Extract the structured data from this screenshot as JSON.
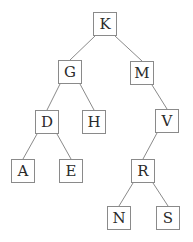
{
  "diagram": {
    "type": "binary-tree",
    "nodes": [
      {
        "id": "K",
        "label": "K",
        "x": 93,
        "y": 12
      },
      {
        "id": "G",
        "label": "G",
        "x": 58,
        "y": 60
      },
      {
        "id": "M",
        "label": "M",
        "x": 130,
        "y": 61
      },
      {
        "id": "D",
        "label": "D",
        "x": 35,
        "y": 110
      },
      {
        "id": "H",
        "label": "H",
        "x": 82,
        "y": 110
      },
      {
        "id": "V",
        "label": "V",
        "x": 155,
        "y": 109
      },
      {
        "id": "A",
        "label": "A",
        "x": 11,
        "y": 159
      },
      {
        "id": "E",
        "label": "E",
        "x": 59,
        "y": 159
      },
      {
        "id": "R",
        "label": "R",
        "x": 131,
        "y": 159
      },
      {
        "id": "N",
        "label": "N",
        "x": 107,
        "y": 206
      },
      {
        "id": "S",
        "label": "S",
        "x": 156,
        "y": 206
      }
    ],
    "edges": [
      [
        "K",
        "G"
      ],
      [
        "K",
        "M"
      ],
      [
        "G",
        "D"
      ],
      [
        "G",
        "H"
      ],
      [
        "M",
        "V"
      ],
      [
        "D",
        "A"
      ],
      [
        "D",
        "E"
      ],
      [
        "V",
        "R"
      ],
      [
        "R",
        "N"
      ],
      [
        "R",
        "S"
      ]
    ],
    "colors": {
      "border": "#8a8a8a",
      "edge": "#8a8a8a",
      "text": "#2a2a2a"
    }
  }
}
